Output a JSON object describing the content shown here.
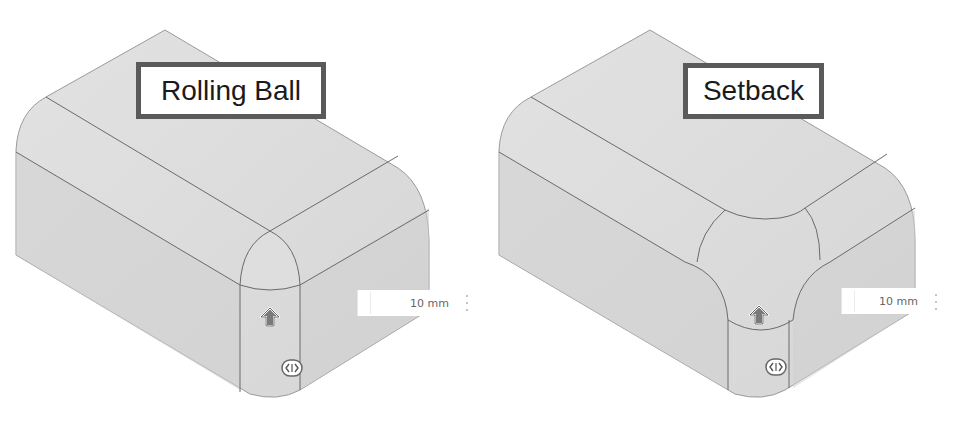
{
  "panels": [
    {
      "id": "rolling-ball",
      "label": "Rolling Ball",
      "dimension_input": {
        "value": "10 mm"
      },
      "colors": {
        "fill_top": "#dcdcdc",
        "fill_side": "#d2d2d2",
        "edge": "#6a6a6a",
        "outline": "#9a9a9a"
      }
    },
    {
      "id": "setback",
      "label": "Setback",
      "dimension_input": {
        "value": "10 mm"
      },
      "colors": {
        "fill_top": "#dcdcdc",
        "fill_side": "#d2d2d2",
        "edge": "#6a6a6a",
        "outline": "#9a9a9a"
      }
    }
  ],
  "icons": {
    "direction_handle": "up-arrow-icon",
    "drag_handle": "horizontal-drag-icon",
    "more_menu": "vertical-dots-icon"
  }
}
